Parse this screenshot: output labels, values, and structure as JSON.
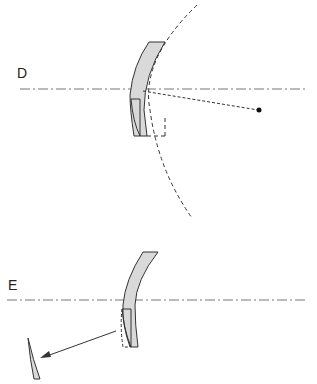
{
  "panels": [
    {
      "id": "D",
      "label": "D",
      "description": "Meniscus lens on optical axis with dashed reference sphere and a dotted ray to a focal point"
    },
    {
      "id": "E",
      "label": "E",
      "description": "Meniscus lens with a cut-out edge segment shown removed via an arrow"
    }
  ],
  "colors": {
    "lens_fill": "#d9d9d9",
    "stroke": "#333333",
    "axis": "#666666",
    "background": "#ffffff"
  }
}
